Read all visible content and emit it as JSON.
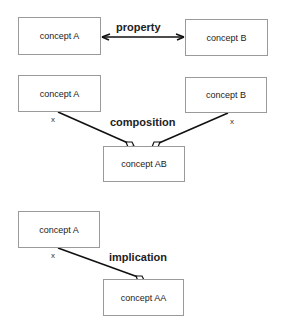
{
  "panels": {
    "property": {
      "source": {
        "label": "concept A"
      },
      "target": {
        "label": "concept B"
      },
      "relation": {
        "label": "property",
        "type": "bidirectional-arrow"
      }
    },
    "composition": {
      "source_a": {
        "label": "concept A",
        "multiplicity": "x"
      },
      "source_b": {
        "label": "concept B",
        "multiplicity": "x"
      },
      "target": {
        "label": "concept AB"
      },
      "relation": {
        "label": "composition",
        "type": "diamond-aggregation"
      }
    },
    "implication": {
      "source": {
        "label": "concept A",
        "multiplicity": "x"
      },
      "target": {
        "label": "concept AA"
      },
      "relation": {
        "label": "implication",
        "type": "diamond-aggregation"
      }
    }
  },
  "colors": {
    "box_border": "#9a9a9a",
    "line": "#111111",
    "text": "#222222"
  }
}
